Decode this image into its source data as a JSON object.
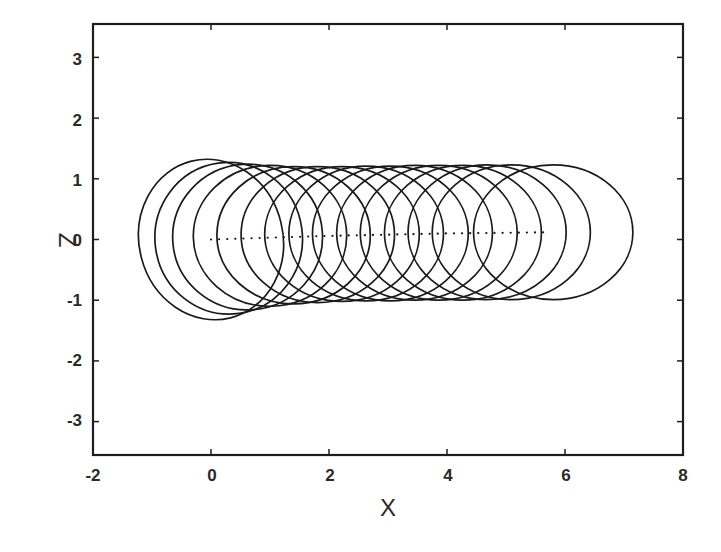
{
  "chart_data": {
    "type": "line",
    "title": "",
    "xlabel": "X",
    "ylabel": "Z",
    "xlim": [
      -2,
      8
    ],
    "ylim": [
      -3.55,
      3.55
    ],
    "xticks": [
      -2,
      0,
      2,
      4,
      6,
      8
    ],
    "yticks": [
      3,
      2,
      1,
      0,
      -1,
      -2,
      -3
    ],
    "xtick_labels": [
      "-2",
      "0",
      "2",
      "4",
      "6",
      "8"
    ],
    "ytick_labels": [
      "3",
      "2",
      "1",
      "0",
      "-1",
      "-2",
      "-3"
    ],
    "grid": false,
    "legend": null,
    "series": [
      {
        "name": "orbit loops",
        "style": "solid",
        "color": "#1a1a1a",
        "description": "Overlapping closed loops (15) translating along +X; first loop tilted transient",
        "loops": [
          {
            "cx": 0.0,
            "cz": 0.0,
            "rx": 1.22,
            "rz": 1.33,
            "tilt_deg": -14
          },
          {
            "cx": 0.3,
            "cz": 0.02,
            "rx": 1.25,
            "rz": 1.25,
            "tilt_deg": -8
          },
          {
            "cx": 0.62,
            "cz": 0.04,
            "rx": 1.27,
            "rz": 1.2,
            "tilt_deg": -4
          },
          {
            "cx": 1.0,
            "cz": 0.06,
            "rx": 1.3,
            "rz": 1.16,
            "tilt_deg": -1
          },
          {
            "cx": 1.4,
            "cz": 0.07,
            "rx": 1.3,
            "rz": 1.13,
            "tilt_deg": 0
          },
          {
            "cx": 1.81,
            "cz": 0.08,
            "rx": 1.3,
            "rz": 1.12,
            "tilt_deg": 0
          },
          {
            "cx": 2.22,
            "cz": 0.09,
            "rx": 1.31,
            "rz": 1.11,
            "tilt_deg": 0
          },
          {
            "cx": 2.63,
            "cz": 0.1,
            "rx": 1.31,
            "rz": 1.11,
            "tilt_deg": 0
          },
          {
            "cx": 3.04,
            "cz": 0.1,
            "rx": 1.32,
            "rz": 1.11,
            "tilt_deg": 0
          },
          {
            "cx": 3.45,
            "cz": 0.11,
            "rx": 1.32,
            "rz": 1.11,
            "tilt_deg": 0
          },
          {
            "cx": 3.86,
            "cz": 0.11,
            "rx": 1.33,
            "rz": 1.11,
            "tilt_deg": 0
          },
          {
            "cx": 4.27,
            "cz": 0.11,
            "rx": 1.33,
            "rz": 1.11,
            "tilt_deg": 0
          },
          {
            "cx": 4.68,
            "cz": 0.12,
            "rx": 1.34,
            "rz": 1.11,
            "tilt_deg": 0
          },
          {
            "cx": 5.09,
            "cz": 0.12,
            "rx": 1.34,
            "rz": 1.11,
            "tilt_deg": 0
          },
          {
            "cx": 5.8,
            "cz": 0.12,
            "rx": 1.35,
            "rz": 1.11,
            "tilt_deg": 0
          }
        ]
      },
      {
        "name": "guiding center",
        "style": "dotted",
        "color": "#1a1a1a",
        "x": [
          0.0,
          1.0,
          2.0,
          3.0,
          4.0,
          5.0,
          5.7
        ],
        "y": [
          0.0,
          0.03,
          0.06,
          0.08,
          0.1,
          0.11,
          0.12
        ]
      }
    ],
    "envelope": {
      "top_z": 1.22,
      "bottom_z": -1.0
    }
  }
}
